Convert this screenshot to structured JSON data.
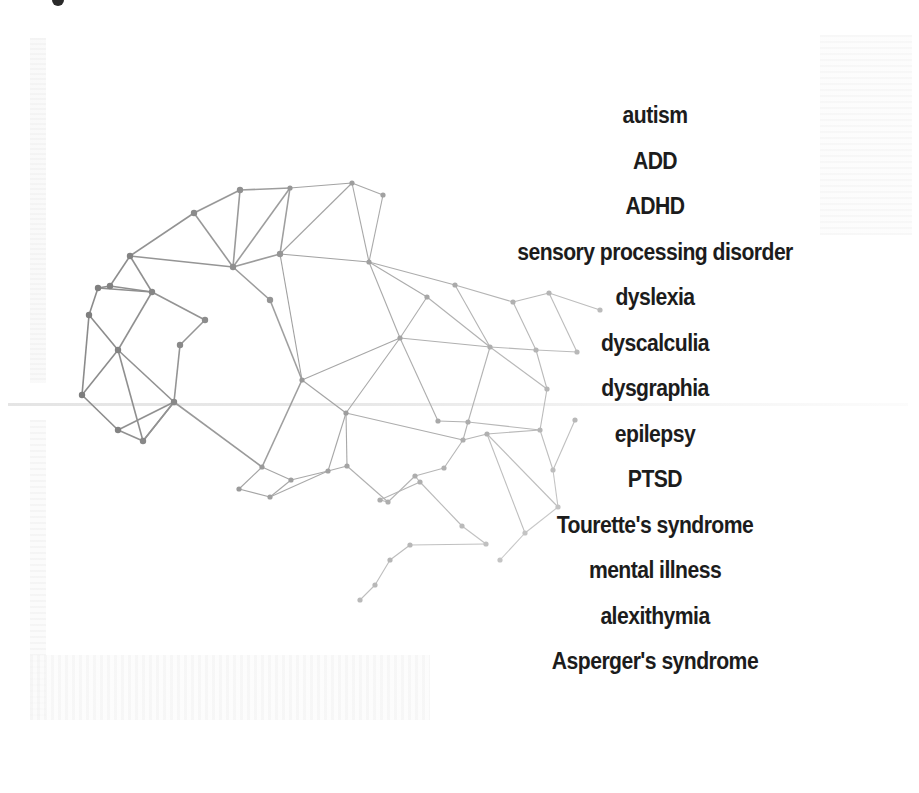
{
  "illustration": {
    "name": "brain-network",
    "stroke_dark": "#8a8a8a",
    "stroke_light": "#d2d2d2",
    "node_dark": "#7d7d7d",
    "node_light": "#d0d0d0",
    "nodes": [
      [
        82,
        395
      ],
      [
        89,
        315
      ],
      [
        98,
        288
      ],
      [
        110,
        286
      ],
      [
        118,
        350
      ],
      [
        130,
        256
      ],
      [
        152,
        292
      ],
      [
        174,
        402
      ],
      [
        143,
        441
      ],
      [
        118,
        430
      ],
      [
        194,
        213
      ],
      [
        240,
        190
      ],
      [
        233,
        267
      ],
      [
        290,
        188
      ],
      [
        280,
        254
      ],
      [
        352,
        183
      ],
      [
        383,
        195
      ],
      [
        369,
        262
      ],
      [
        455,
        285
      ],
      [
        400,
        338
      ],
      [
        346,
        413
      ],
      [
        302,
        380
      ],
      [
        262,
        467
      ],
      [
        239,
        489
      ],
      [
        270,
        497
      ],
      [
        291,
        480
      ],
      [
        328,
        471
      ],
      [
        347,
        466
      ],
      [
        388,
        502
      ],
      [
        415,
        476
      ],
      [
        380,
        500
      ],
      [
        444,
        468
      ],
      [
        463,
        440
      ],
      [
        487,
        434
      ],
      [
        462,
        526
      ],
      [
        486,
        544
      ],
      [
        420,
        482
      ],
      [
        536,
        350
      ],
      [
        549,
        293
      ],
      [
        513,
        302
      ],
      [
        577,
        352
      ],
      [
        547,
        389
      ],
      [
        540,
        430
      ],
      [
        553,
        470
      ],
      [
        558,
        507
      ],
      [
        525,
        533
      ],
      [
        490,
        347
      ],
      [
        427,
        297
      ],
      [
        468,
        422
      ],
      [
        438,
        421
      ],
      [
        270,
        300
      ],
      [
        205,
        320
      ],
      [
        180,
        345
      ],
      [
        410,
        545
      ],
      [
        390,
        560
      ],
      [
        375,
        585
      ],
      [
        360,
        600
      ],
      [
        500,
        560
      ],
      [
        600,
        310
      ],
      [
        575,
        420
      ]
    ],
    "edges": [
      [
        0,
        1
      ],
      [
        1,
        2
      ],
      [
        2,
        3
      ],
      [
        3,
        5
      ],
      [
        5,
        10
      ],
      [
        10,
        11
      ],
      [
        11,
        13
      ],
      [
        13,
        15
      ],
      [
        15,
        16
      ],
      [
        1,
        4
      ],
      [
        0,
        4
      ],
      [
        4,
        6
      ],
      [
        6,
        5
      ],
      [
        6,
        3
      ],
      [
        2,
        6
      ],
      [
        5,
        12
      ],
      [
        10,
        12
      ],
      [
        11,
        12
      ],
      [
        12,
        13
      ],
      [
        13,
        14
      ],
      [
        14,
        15
      ],
      [
        12,
        14
      ],
      [
        14,
        17
      ],
      [
        15,
        17
      ],
      [
        16,
        17
      ],
      [
        17,
        18
      ],
      [
        17,
        19
      ],
      [
        14,
        21
      ],
      [
        21,
        19
      ],
      [
        19,
        20
      ],
      [
        4,
        8
      ],
      [
        0,
        9
      ],
      [
        9,
        8
      ],
      [
        8,
        7
      ],
      [
        7,
        4
      ],
      [
        7,
        9
      ],
      [
        8,
        7
      ],
      [
        7,
        22
      ],
      [
        22,
        23
      ],
      [
        23,
        24
      ],
      [
        24,
        25
      ],
      [
        22,
        25
      ],
      [
        25,
        26
      ],
      [
        26,
        27
      ],
      [
        22,
        21
      ],
      [
        21,
        20
      ],
      [
        20,
        27
      ],
      [
        20,
        26
      ],
      [
        27,
        28
      ],
      [
        28,
        29
      ],
      [
        29,
        31
      ],
      [
        31,
        32
      ],
      [
        32,
        33
      ],
      [
        20,
        32
      ],
      [
        19,
        46
      ],
      [
        46,
        37
      ],
      [
        37,
        39
      ],
      [
        39,
        38
      ],
      [
        38,
        40
      ],
      [
        40,
        37
      ],
      [
        37,
        41
      ],
      [
        41,
        42
      ],
      [
        42,
        43
      ],
      [
        43,
        44
      ],
      [
        44,
        45
      ],
      [
        45,
        33
      ],
      [
        33,
        42
      ],
      [
        41,
        46
      ],
      [
        46,
        48
      ],
      [
        48,
        32
      ],
      [
        48,
        49
      ],
      [
        49,
        19
      ],
      [
        18,
        39
      ],
      [
        18,
        46
      ],
      [
        17,
        47
      ],
      [
        47,
        46
      ],
      [
        47,
        19
      ],
      [
        29,
        36
      ],
      [
        36,
        34
      ],
      [
        34,
        35
      ],
      [
        35,
        53
      ],
      [
        53,
        54
      ],
      [
        54,
        55
      ],
      [
        55,
        56
      ],
      [
        30,
        28
      ],
      [
        30,
        36
      ],
      [
        24,
        26
      ],
      [
        12,
        50
      ],
      [
        50,
        21
      ],
      [
        6,
        51
      ],
      [
        51,
        52
      ],
      [
        52,
        7
      ],
      [
        42,
        48
      ],
      [
        33,
        44
      ],
      [
        45,
        57
      ],
      [
        38,
        58
      ],
      [
        43,
        59
      ]
    ]
  },
  "conditions": [
    "autism",
    "ADD",
    "ADHD",
    "sensory processing disorder",
    "dyslexia",
    "dyscalculia",
    "dysgraphia",
    "epilepsy",
    "PTSD",
    "Tourette's syndrome",
    "mental illness",
    "alexithymia",
    "Asperger's syndrome"
  ]
}
